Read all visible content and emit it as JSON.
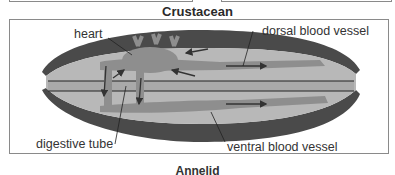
{
  "diagram": {
    "title": "Crustacean",
    "labels": {
      "heart": "heart",
      "dorsal": "dorsal blood vessel",
      "digestive": "digestive tube",
      "ventral": "ventral blood vessel"
    },
    "caption": "Annelid",
    "colors": {
      "body_dark": "#4a4a4a",
      "body_light": "#b8b8b8",
      "vessel": "#8e8e8e",
      "arrow": "#333333",
      "frame": "#8a8a8a"
    }
  }
}
